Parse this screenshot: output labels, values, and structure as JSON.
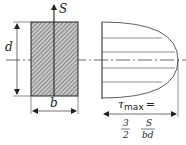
{
  "diagram": {
    "force_label": "S",
    "height_label": "d",
    "width_label": "b",
    "tau_symbol": "τ",
    "tau_subscript": "max",
    "equals": "=",
    "fraction1": {
      "numerator": "3",
      "denominator": "2"
    },
    "fraction2": {
      "numerator": "S",
      "denominator": "bd"
    },
    "colors": {
      "line": "#222222",
      "hatch_fill": "#9a9a9a",
      "background": "#ffffff"
    }
  }
}
